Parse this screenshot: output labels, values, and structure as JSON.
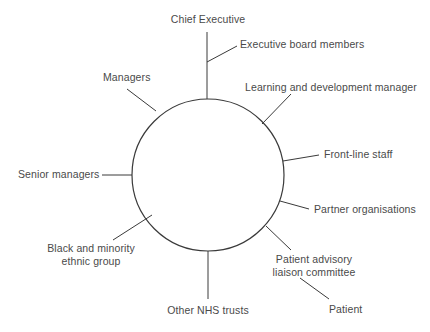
{
  "diagram": {
    "type": "hub-and-spoke-stakeholder-map",
    "hub": {
      "shape": "circle",
      "label": "",
      "stroke_color": "#3a3a3a"
    },
    "text_color": "#4a4a4a",
    "background_color": "#ffffff",
    "nodes": [
      {
        "id": "chief-executive",
        "label": "Chief Executive",
        "position": "top",
        "align": "center"
      },
      {
        "id": "executive-board-members",
        "label": "Executive board members",
        "position": "top-right",
        "align": "left"
      },
      {
        "id": "learning-and-development-manager",
        "label": "Learning and development manager",
        "position": "upper-right",
        "align": "left"
      },
      {
        "id": "front-line-staff",
        "label": "Front-line staff",
        "position": "right",
        "align": "left"
      },
      {
        "id": "partner-organisations",
        "label": "Partner organisations",
        "position": "lower-right",
        "align": "left"
      },
      {
        "id": "patient-advisory-liaison-committee",
        "label": "Patient advisory\nliaison committee",
        "position": "bottom-right",
        "align": "center"
      },
      {
        "id": "patient",
        "label": "Patient",
        "position": "bottom-right-outer",
        "align": "left"
      },
      {
        "id": "other-nhs-trusts",
        "label": "Other NHS trusts",
        "position": "bottom",
        "align": "center"
      },
      {
        "id": "black-and-minority-ethnic-group",
        "label": "Black and minority\nethnic group",
        "position": "bottom-left",
        "align": "center"
      },
      {
        "id": "senior-managers",
        "label": "Senior managers",
        "position": "left",
        "align": "left"
      },
      {
        "id": "managers",
        "label": "Managers",
        "position": "upper-left",
        "align": "left"
      }
    ]
  }
}
